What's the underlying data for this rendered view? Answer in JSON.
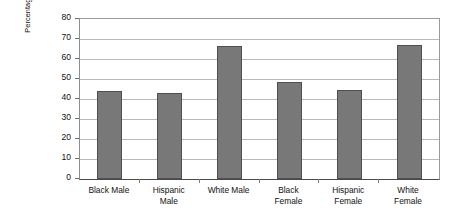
{
  "chart_data": {
    "type": "bar",
    "title": "",
    "xlabel": "",
    "ylabel": "Percentage Included in the Regular Classroom More Than 20% of Time",
    "categories": [
      "Black Male",
      "Hispanic Male",
      "White Male",
      "Black Female",
      "Hispanic Female",
      "White Female"
    ],
    "category_lines": [
      [
        "Black Male"
      ],
      [
        "Hispanic",
        "Male"
      ],
      [
        "White Male"
      ],
      [
        "Black",
        "Female"
      ],
      [
        "Hispanic",
        "Female"
      ],
      [
        "White",
        "Female"
      ]
    ],
    "values": [
      44,
      43,
      66.5,
      48.5,
      44.5,
      67
    ],
    "ylim": [
      0,
      80
    ],
    "ytick_labels": [
      "80",
      "70",
      "60",
      "50",
      "40",
      "30",
      "20",
      "10",
      "0"
    ],
    "ytick_values": [
      80,
      70,
      60,
      50,
      40,
      30,
      20,
      10,
      0
    ],
    "grid": true,
    "legend": false,
    "colors": {
      "bar_fill": "#787878",
      "bar_border": "#4f4f4f",
      "gridline": "#b9b9b9",
      "axis": "#4a4a4a",
      "text": "#111111",
      "background": "#ffffff"
    }
  }
}
